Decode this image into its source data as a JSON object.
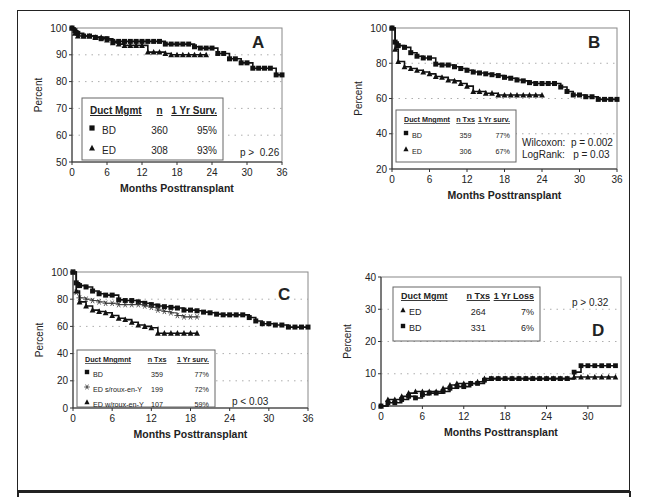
{
  "chart_data": [
    {
      "id": "A",
      "type": "line",
      "panel_label": "A",
      "title": "",
      "xlabel": "Months Posttransplant",
      "ylabel": "Percent",
      "xlim": [
        0,
        36
      ],
      "ylim": [
        50,
        100
      ],
      "xticks": [
        0,
        6,
        12,
        18,
        24,
        30,
        36
      ],
      "yticks": [
        50,
        60,
        70,
        80,
        90,
        100
      ],
      "grid": "dotted horizontal",
      "legend": {
        "headers": [
          "Duct Mgmt",
          "n",
          "1 Yr Surv."
        ],
        "rows": [
          {
            "marker": "square",
            "label": "BD",
            "n": "360",
            "surv": "95%"
          },
          {
            "marker": "triangle",
            "label": "ED",
            "n": "308",
            "surv": "93%"
          }
        ]
      },
      "annotations": [
        "p >  0.26"
      ],
      "series": [
        {
          "name": "BD",
          "marker": "square",
          "x": [
            0,
            0.5,
            1,
            2,
            3,
            4,
            5,
            6,
            7,
            8,
            9,
            10,
            11,
            12,
            13,
            14,
            15,
            16,
            17,
            18,
            19,
            20,
            21,
            22,
            23,
            24,
            25,
            26,
            27,
            28,
            29,
            30,
            31,
            32,
            33,
            34,
            35,
            36
          ],
          "y": [
            100,
            99,
            98,
            97,
            97,
            96.5,
            96,
            96,
            95,
            95,
            95,
            95,
            95,
            95,
            95,
            95,
            95,
            94,
            94,
            94,
            94,
            94,
            93,
            92.5,
            92.5,
            92.5,
            90.5,
            90.5,
            88.5,
            88.5,
            87,
            87,
            85,
            85,
            85,
            85,
            82.5,
            82.5
          ]
        },
        {
          "name": "ED",
          "marker": "triangle",
          "x": [
            0,
            0.5,
            1,
            2,
            3,
            4,
            5,
            6,
            7,
            8,
            9,
            10,
            11,
            12,
            13,
            14,
            15,
            16,
            17,
            18,
            19,
            20,
            21,
            22,
            23
          ],
          "y": [
            100,
            98,
            97,
            97,
            97,
            96.5,
            96.5,
            95.5,
            94.5,
            94,
            93.5,
            93.5,
            93.5,
            93.5,
            91,
            91,
            91,
            90.5,
            90,
            90,
            90,
            90,
            90,
            90,
            90
          ]
        }
      ]
    },
    {
      "id": "B",
      "type": "line",
      "panel_label": "B",
      "title": "",
      "xlabel": "Months Posttransplant",
      "ylabel": "Percent",
      "xlim": [
        0,
        36
      ],
      "ylim": [
        20,
        100
      ],
      "xticks": [
        0,
        6,
        12,
        18,
        24,
        30,
        36
      ],
      "yticks": [
        20,
        40,
        60,
        80,
        100
      ],
      "grid": "dotted horizontal",
      "legend": {
        "headers": [
          "Duct Mngmnt",
          "n Txs",
          "1 Yr surv."
        ],
        "rows": [
          {
            "marker": "square",
            "label": "BD",
            "n": "359",
            "surv": "77%"
          },
          {
            "marker": "triangle",
            "label": "ED",
            "n": "306",
            "surv": "67%"
          }
        ]
      },
      "annotations": [
        "Wilcoxon:  p = 0.002",
        "LogRank:   p = 0.03"
      ],
      "series": [
        {
          "name": "BD",
          "marker": "square",
          "x": [
            0,
            0.5,
            1,
            2,
            3,
            4,
            5,
            6,
            7,
            8,
            9,
            10,
            11,
            12,
            13,
            14,
            15,
            16,
            17,
            18,
            19,
            20,
            21,
            22,
            23,
            24,
            25,
            26,
            27,
            28,
            29,
            30,
            31,
            32,
            33,
            34,
            35,
            36
          ],
          "y": [
            100,
            92,
            90,
            89,
            86,
            84,
            83,
            83,
            79.5,
            79,
            79,
            78,
            77,
            76,
            75,
            74.5,
            74,
            73.5,
            73,
            72,
            71.5,
            70.5,
            70,
            69,
            68.5,
            68.5,
            68.5,
            68.5,
            66.5,
            64,
            62,
            62,
            61,
            61,
            59.5,
            59.5,
            59.5,
            59.5
          ]
        },
        {
          "name": "ED",
          "marker": "triangle",
          "x": [
            0,
            0.5,
            1,
            2,
            3,
            4,
            5,
            6,
            7,
            8,
            9,
            10,
            11,
            12,
            13,
            14,
            15,
            16,
            17,
            18,
            19,
            20,
            21,
            22,
            23,
            24
          ],
          "y": [
            100,
            88,
            81,
            78,
            77,
            76,
            75,
            74,
            72.5,
            72,
            70.5,
            70,
            68.5,
            67,
            64,
            64,
            63,
            63,
            62,
            62,
            62,
            62,
            62,
            62,
            62,
            62
          ]
        }
      ]
    },
    {
      "id": "C",
      "type": "line",
      "panel_label": "C",
      "title": "",
      "xlabel": "Months Posttransplant",
      "ylabel": "Percent",
      "xlim": [
        0,
        36
      ],
      "ylim": [
        0,
        100
      ],
      "xticks": [
        0,
        6,
        12,
        18,
        24,
        30,
        36
      ],
      "yticks": [
        0,
        20,
        40,
        60,
        80,
        100
      ],
      "grid": "dotted horizontal",
      "legend": {
        "headers": [
          "Duct Mngmnt",
          "n Txs",
          "1 Yr surv."
        ],
        "rows": [
          {
            "marker": "square",
            "label": "BD",
            "n": "359",
            "surv": "77%"
          },
          {
            "marker": "star",
            "label": "ED s/roux-en-Y",
            "n": "199",
            "surv": "72%"
          },
          {
            "marker": "triangle",
            "label": "ED w/roux-en-Y",
            "n": "107",
            "surv": "59%"
          }
        ]
      },
      "annotations": [
        "p < 0.03"
      ],
      "series": [
        {
          "name": "BD",
          "marker": "square",
          "x": [
            0,
            0.5,
            1,
            2,
            3,
            4,
            5,
            6,
            7,
            8,
            9,
            10,
            11,
            12,
            13,
            14,
            15,
            16,
            17,
            18,
            19,
            20,
            21,
            22,
            23,
            24,
            25,
            26,
            27,
            28,
            29,
            30,
            31,
            32,
            33,
            34,
            35,
            36
          ],
          "y": [
            100,
            92,
            90,
            89,
            86,
            84,
            83,
            83,
            79.5,
            79,
            79,
            78,
            77,
            76,
            75,
            74.5,
            74,
            73.5,
            72,
            72,
            71.5,
            70.5,
            70,
            69,
            68.5,
            68.5,
            68.5,
            68.5,
            66.5,
            64,
            62,
            62,
            61,
            61,
            59.5,
            59.5,
            59.5,
            59.5
          ]
        },
        {
          "name": "ED s/roux-en-Y",
          "marker": "star",
          "x": [
            0,
            0.5,
            1,
            2,
            3,
            4,
            5,
            6,
            7,
            8,
            9,
            10,
            11,
            12,
            13,
            14,
            15,
            16,
            17,
            18,
            19
          ],
          "y": [
            100,
            85,
            81,
            80,
            79,
            78,
            77,
            77,
            76,
            76,
            76,
            76,
            75,
            74,
            72,
            71,
            70,
            68,
            67,
            67,
            67
          ]
        },
        {
          "name": "ED w/roux-en-Y",
          "marker": "triangle",
          "x": [
            0,
            0.5,
            1,
            2,
            3,
            4,
            5,
            6,
            7,
            8,
            9,
            10,
            11,
            12,
            13,
            14,
            15,
            16,
            17,
            18,
            19
          ],
          "y": [
            100,
            86,
            78,
            75,
            72,
            71,
            70,
            68,
            66,
            65,
            63,
            61,
            60,
            59,
            55,
            55,
            55,
            55,
            55,
            55,
            55
          ]
        }
      ]
    },
    {
      "id": "D",
      "type": "line",
      "panel_label": "D",
      "title": "",
      "xlabel": "Months Posttransplant",
      "ylabel": "Percent",
      "xlim": [
        0,
        34.8
      ],
      "ylim": [
        0,
        40
      ],
      "xticks": [
        0,
        6,
        12,
        18,
        24,
        30
      ],
      "yticks": [
        0,
        10,
        20,
        30,
        40
      ],
      "grid": "dotted horizontal",
      "legend": {
        "headers": [
          "Duct Mgmt",
          "n Txs",
          "1 Yr Loss"
        ],
        "rows": [
          {
            "marker": "triangle",
            "label": "ED",
            "n": "264",
            "surv": "7%"
          },
          {
            "marker": "square",
            "label": "BD",
            "n": "331",
            "surv": "6%"
          }
        ]
      },
      "annotations": [
        "p > 0.32"
      ],
      "series": [
        {
          "name": "ED",
          "marker": "triangle",
          "x": [
            0,
            1,
            2,
            3,
            4,
            5,
            6,
            7,
            8,
            9,
            10,
            11,
            12,
            13,
            14,
            15,
            16,
            17,
            18,
            19,
            20,
            21,
            22,
            23,
            24,
            25,
            26,
            27,
            28,
            29,
            30,
            31,
            32,
            33,
            34
          ],
          "y": [
            0,
            2,
            2,
            3,
            4,
            4.5,
            4.5,
            4.5,
            4.5,
            5.5,
            6.5,
            7,
            7,
            7,
            7.5,
            8.5,
            8.5,
            8.5,
            8.5,
            8.5,
            8.5,
            8.5,
            8.5,
            8.5,
            8.5,
            8.5,
            8.5,
            8.5,
            9,
            9,
            9,
            9,
            9,
            9,
            9
          ]
        },
        {
          "name": "BD",
          "marker": "square",
          "x": [
            0,
            1,
            2,
            3,
            4,
            5,
            6,
            7,
            8,
            9,
            10,
            11,
            12,
            13,
            14,
            15,
            16,
            17,
            18,
            19,
            20,
            21,
            22,
            23,
            24,
            25,
            26,
            27,
            28,
            29,
            30,
            31,
            32,
            33,
            34
          ],
          "y": [
            0,
            1,
            1,
            2,
            3,
            2.5,
            3.5,
            4,
            4,
            4.5,
            5.5,
            6,
            6,
            7,
            7,
            8,
            8.5,
            8.5,
            8.5,
            8.5,
            8.5,
            8.5,
            8.5,
            8.5,
            8.5,
            8.5,
            8.5,
            8.5,
            10.5,
            12.5,
            12.5,
            12.5,
            12.5,
            12.5,
            12.5
          ]
        }
      ]
    }
  ],
  "layout": {
    "A": {
      "x0": 72,
      "x1": 282,
      "y0": 28,
      "y1": 162,
      "label_pos": [
        252,
        48
      ],
      "legend_box": [
        82,
        98,
        141,
        62
      ],
      "ann_pos": [
        [
          240,
          156
        ]
      ]
    },
    "B": {
      "x0": 392,
      "x1": 617,
      "y0": 28,
      "y1": 169,
      "label_pos": [
        588,
        48
      ],
      "legend_box": [
        396,
        110,
        120,
        52
      ],
      "ann_pos": [
        [
          522,
          146
        ],
        [
          522,
          158
        ]
      ]
    },
    "C": {
      "x0": 73,
      "x1": 308,
      "y0": 272,
      "y1": 408,
      "label_pos": [
        278,
        300
      ],
      "legend_box": [
        77,
        350,
        138,
        57
      ],
      "ann_pos": [
        [
          232,
          405
        ]
      ]
    },
    "D": {
      "x0": 381,
      "x1": 621,
      "y0": 277,
      "y1": 406,
      "label_pos": [
        592,
        336
      ],
      "legend_box": [
        393,
        287,
        147,
        54
      ],
      "ann_pos": [
        [
          572,
          306
        ]
      ]
    }
  }
}
